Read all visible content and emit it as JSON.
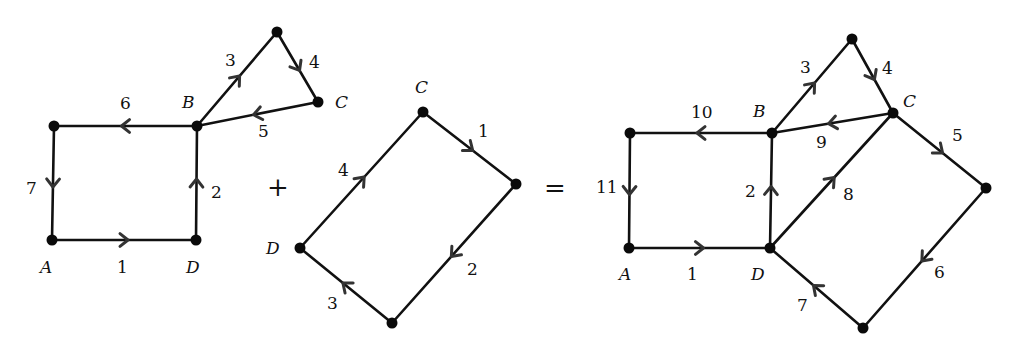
{
  "diagram": {
    "operators": {
      "plus": "+",
      "equals": "="
    },
    "graphs": [
      {
        "id": "graph1",
        "nodes": [
          {
            "id": "TL",
            "x": 54,
            "y": 126,
            "label": ""
          },
          {
            "id": "B",
            "x": 197,
            "y": 126,
            "label": "B",
            "lx": 182,
            "ly": 108
          },
          {
            "id": "A",
            "x": 52,
            "y": 240,
            "label": "A",
            "lx": 40,
            "ly": 273
          },
          {
            "id": "D",
            "x": 196,
            "y": 240,
            "label": "D",
            "lx": 186,
            "ly": 273
          },
          {
            "id": "T",
            "x": 277,
            "y": 32,
            "label": ""
          },
          {
            "id": "C",
            "x": 318,
            "y": 102,
            "label": "C",
            "lx": 335,
            "ly": 108
          }
        ],
        "edges": [
          {
            "from": "A",
            "to": "D",
            "label": "1",
            "lx": 117,
            "ly": 273
          },
          {
            "from": "D",
            "to": "B",
            "label": "2",
            "lx": 211,
            "ly": 198
          },
          {
            "from": "B",
            "to": "T",
            "label": "3",
            "lx": 225,
            "ly": 66
          },
          {
            "from": "T",
            "to": "C",
            "label": "4",
            "lx": 309,
            "ly": 68
          },
          {
            "from": "C",
            "to": "B",
            "label": "5",
            "lx": 258,
            "ly": 137
          },
          {
            "from": "B",
            "to": "TL",
            "label": "6",
            "lx": 120,
            "ly": 109
          },
          {
            "from": "TL",
            "to": "A",
            "label": "7",
            "lx": 26,
            "ly": 194
          }
        ]
      },
      {
        "id": "graph2",
        "nodes": [
          {
            "id": "C",
            "x": 423,
            "y": 112,
            "label": "C",
            "lx": 415,
            "ly": 93
          },
          {
            "id": "R",
            "x": 516,
            "y": 184,
            "label": ""
          },
          {
            "id": "Bot",
            "x": 392,
            "y": 323,
            "label": ""
          },
          {
            "id": "D",
            "x": 300,
            "y": 248,
            "label": "D",
            "lx": 266,
            "ly": 254
          }
        ],
        "edges": [
          {
            "from": "C",
            "to": "R",
            "label": "1",
            "lx": 478,
            "ly": 137
          },
          {
            "from": "R",
            "to": "Bot",
            "label": "2",
            "lx": 467,
            "ly": 275
          },
          {
            "from": "Bot",
            "to": "D",
            "label": "3",
            "lx": 327,
            "ly": 309
          },
          {
            "from": "D",
            "to": "C",
            "label": "4",
            "lx": 338,
            "ly": 176
          }
        ]
      },
      {
        "id": "graph3",
        "nodes": [
          {
            "id": "TL",
            "x": 630,
            "y": 133,
            "label": ""
          },
          {
            "id": "B",
            "x": 772,
            "y": 133,
            "label": "B",
            "lx": 753,
            "ly": 117
          },
          {
            "id": "A",
            "x": 629,
            "y": 248,
            "label": "A",
            "lx": 619,
            "ly": 280
          },
          {
            "id": "D",
            "x": 770,
            "y": 248,
            "label": "D",
            "lx": 751,
            "ly": 280
          },
          {
            "id": "T",
            "x": 852,
            "y": 39,
            "label": ""
          },
          {
            "id": "C",
            "x": 893,
            "y": 113,
            "label": "C",
            "lx": 903,
            "ly": 107
          },
          {
            "id": "R",
            "x": 986,
            "y": 188,
            "label": ""
          },
          {
            "id": "Bot",
            "x": 863,
            "y": 328,
            "label": ""
          }
        ],
        "edges": [
          {
            "from": "A",
            "to": "D",
            "label": "1",
            "lx": 687,
            "ly": 280
          },
          {
            "from": "D",
            "to": "B",
            "label": "2",
            "lx": 745,
            "ly": 197
          },
          {
            "from": "B",
            "to": "T",
            "label": "3",
            "lx": 800,
            "ly": 73
          },
          {
            "from": "T",
            "to": "C",
            "label": "4",
            "lx": 882,
            "ly": 74
          },
          {
            "from": "C",
            "to": "R",
            "label": "5",
            "lx": 952,
            "ly": 141
          },
          {
            "from": "R",
            "to": "Bot",
            "label": "6",
            "lx": 934,
            "ly": 278
          },
          {
            "from": "Bot",
            "to": "D",
            "label": "7",
            "lx": 797,
            "ly": 311
          },
          {
            "from": "D",
            "to": "C",
            "label": "8",
            "lx": 843,
            "ly": 200
          },
          {
            "from": "C",
            "to": "B",
            "label": "9",
            "lx": 816,
            "ly": 148
          },
          {
            "from": "B",
            "to": "TL",
            "label": "10",
            "lx": 691,
            "ly": 118
          },
          {
            "from": "TL",
            "to": "A",
            "label": "11",
            "lx": 596,
            "ly": 193
          }
        ]
      }
    ],
    "operator_positions": {
      "plus": {
        "x": 278,
        "y": 187
      },
      "equals": {
        "x": 555,
        "y": 188
      }
    }
  }
}
